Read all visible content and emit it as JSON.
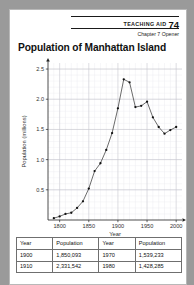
{
  "header": {
    "teaching_aid_label": "TEACHING AID",
    "teaching_aid_number": "74",
    "chapter_line": "Chapter 7 Opener"
  },
  "title": "Population of Manhattan Island",
  "chart_data": {
    "type": "line",
    "title": "Population of Manhattan Island",
    "xlabel": "Year",
    "ylabel": "Population (millions)",
    "xlim": [
      1780,
      2010
    ],
    "ylim": [
      0,
      2.6
    ],
    "xticks": [
      "1800",
      "1850",
      "1900",
      "1950",
      "2000"
    ],
    "xtick_values": [
      1800,
      1850,
      1900,
      1950,
      2000
    ],
    "yticks": [
      "0.5",
      "1.0",
      "1.5",
      "2.0",
      "2.5"
    ],
    "ytick_values": [
      0.5,
      1.0,
      1.5,
      2.0,
      2.5
    ],
    "grid": true,
    "legend": "none",
    "marker": "filled-circle",
    "x": [
      1790,
      1800,
      1810,
      1820,
      1830,
      1840,
      1850,
      1860,
      1870,
      1880,
      1890,
      1900,
      1910,
      1920,
      1930,
      1940,
      1950,
      1960,
      1970,
      1980,
      1990,
      2000
    ],
    "values": [
      0.03,
      0.06,
      0.1,
      0.12,
      0.2,
      0.31,
      0.52,
      0.81,
      0.94,
      1.16,
      1.44,
      1.85,
      2.33,
      2.28,
      1.87,
      1.89,
      1.96,
      1.7,
      1.54,
      1.43,
      1.49,
      1.54
    ]
  },
  "table": {
    "headers": [
      "Year",
      "Population",
      "Year",
      "Population"
    ],
    "rows": [
      [
        "1900",
        "1,850,093",
        "1970",
        "1,539,233"
      ],
      [
        "1910",
        "2,331,542",
        "1980",
        "1,428,285"
      ]
    ]
  }
}
